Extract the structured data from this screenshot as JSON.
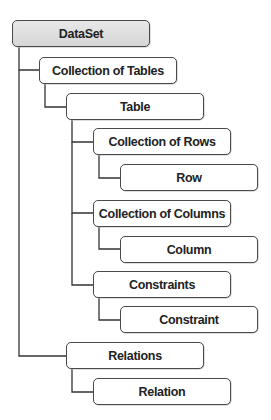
{
  "diagram": {
    "type": "hierarchy-tree",
    "colors": {
      "root_fill": "#dcdcdc",
      "node_fill": "#ffffff",
      "border": "#4a4a4a",
      "connector": "#333333",
      "text": "#222222"
    },
    "nodes": [
      {
        "id": "dataset",
        "label": "DataSet",
        "parent": null
      },
      {
        "id": "collection-of-tables",
        "label": "Collection of Tables",
        "parent": "dataset"
      },
      {
        "id": "table",
        "label": "Table",
        "parent": "collection-of-tables"
      },
      {
        "id": "collection-of-rows",
        "label": "Collection of Rows",
        "parent": "table"
      },
      {
        "id": "row",
        "label": "Row",
        "parent": "collection-of-rows"
      },
      {
        "id": "collection-of-columns",
        "label": "Collection of Columns",
        "parent": "table"
      },
      {
        "id": "column",
        "label": "Column",
        "parent": "collection-of-columns"
      },
      {
        "id": "constraints",
        "label": "Constraints",
        "parent": "table"
      },
      {
        "id": "constraint",
        "label": "Constraint",
        "parent": "constraints"
      },
      {
        "id": "relations",
        "label": "Relations",
        "parent": "dataset"
      },
      {
        "id": "relation",
        "label": "Relation",
        "parent": "relations"
      }
    ]
  }
}
